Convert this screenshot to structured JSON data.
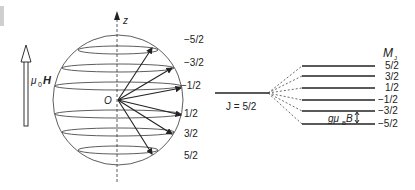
{
  "left": {
    "field_label_mu": "μ",
    "field_label_sub": "0",
    "field_label_H": "H",
    "axis_label": "z",
    "origin_label": "O",
    "mj_labels": [
      "−5/2",
      "−3/2",
      "−1/2",
      "1/2",
      "3/2",
      "5/2"
    ]
  },
  "right": {
    "j_label": "J = 5/2",
    "mj_header": "M",
    "mj_header_sub": "J",
    "levels": [
      "5/2",
      "3/2",
      "1/2",
      "−1/2",
      "−3/2",
      "−5/2"
    ],
    "spacing_label_g": "gμ",
    "spacing_label_sub": "B",
    "spacing_label_B": "B"
  },
  "colors": {
    "line": "#222222",
    "dash": "#444444",
    "sidebar": "#cfcfcf"
  }
}
